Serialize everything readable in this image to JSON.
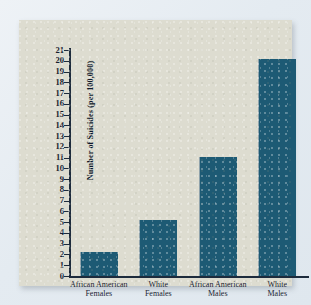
{
  "chart_data": {
    "type": "bar",
    "title": "",
    "xlabel": "Groups",
    "ylabel": "Number of Suicides (per 100,000)",
    "categories": [
      "African American\nFemales",
      "White\nFemales",
      "African American\nMales",
      "White\nMales"
    ],
    "category_lines": [
      [
        "African American",
        "Females"
      ],
      [
        "White",
        "Females"
      ],
      [
        "African American",
        "Males"
      ],
      [
        "White",
        "Males"
      ]
    ],
    "values": [
      2.2,
      5.2,
      11.1,
      20.2
    ],
    "ylim": [
      0,
      21
    ],
    "yticks": [
      0,
      1,
      2,
      3,
      4,
      5,
      6,
      7,
      8,
      9,
      10,
      11,
      12,
      13,
      14,
      15,
      16,
      17,
      18,
      19,
      20,
      21
    ],
    "grid": false,
    "legend": false,
    "bar_color": "#1d5a74",
    "axis_color": "#1d2b3c",
    "panel_color": "#dddcd0",
    "page_background": "#e9eef3"
  },
  "axis": {
    "x_title": "Groups",
    "y_title": "Number of Suicides (per 100,000)"
  },
  "ticks": {
    "t0": "0",
    "t1": "1",
    "t2": "2",
    "t3": "3",
    "t4": "4",
    "t5": "5",
    "t6": "6",
    "t7": "7",
    "t8": "8",
    "t9": "9",
    "t10": "10",
    "t11": "11",
    "t12": "12",
    "t13": "13",
    "t14": "14",
    "t15": "15",
    "t16": "16",
    "t17": "17",
    "t18": "18",
    "t19": "19",
    "t20": "20",
    "t21": "21"
  },
  "categories": {
    "c0": {
      "line1": "African American",
      "line2": "Females"
    },
    "c1": {
      "line1": "White",
      "line2": "Females"
    },
    "c2": {
      "line1": "African American",
      "line2": "Males"
    },
    "c3": {
      "line1": "White",
      "line2": "Males"
    }
  }
}
